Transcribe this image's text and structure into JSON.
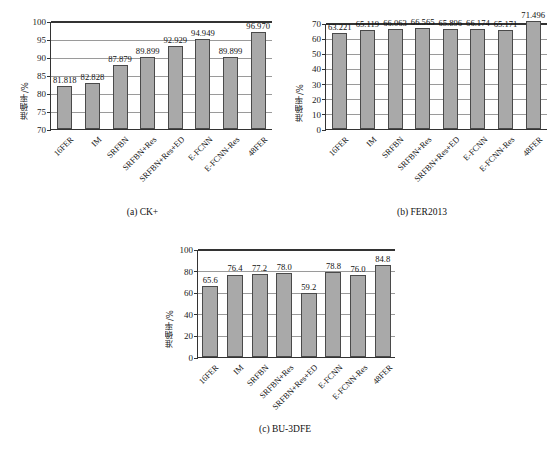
{
  "figure": {
    "background": "#ffffff",
    "bar_fill": "#a9a9a9",
    "bar_stroke": "#4a4a4a",
    "axis_color": "#333333",
    "grid_color": "#9a9a9a"
  },
  "panels": [
    {
      "id": "panel-a",
      "caption": "(a) CK+",
      "chart_data": {
        "type": "bar",
        "title": "(a) CK+",
        "xlabel": "",
        "ylabel": "准确率/%",
        "ylim": [
          70,
          100
        ],
        "ytick_step": 5,
        "yticks": [
          70,
          75,
          80,
          85,
          90,
          95,
          100
        ],
        "grid": true,
        "legend": "none",
        "categories": [
          "16FER",
          "IM",
          "SRFBN",
          "SRFBN+Res",
          "SRFBN+Res+ED",
          "E-FCNN",
          "E-FCNN-Res",
          "48FER"
        ],
        "values": [
          81.818,
          82.828,
          87.879,
          89.899,
          92.929,
          94.949,
          89.899,
          96.97
        ],
        "value_labels": [
          "81.818",
          "82.828",
          "87.879",
          "89.899",
          "92.929",
          "94.949",
          "89.899",
          "96.970"
        ]
      }
    },
    {
      "id": "panel-b",
      "caption": "(b) FER2013",
      "chart_data": {
        "type": "bar",
        "title": "(b) FER2013",
        "xlabel": "",
        "ylabel": "准确率/%",
        "ylim": [
          0,
          70
        ],
        "ytick_step": 10,
        "yticks": [
          0,
          10,
          20,
          30,
          40,
          50,
          60,
          70
        ],
        "grid": true,
        "legend": "none",
        "categories": [
          "16FER",
          "IM",
          "SRFBN",
          "SRFBN+Res",
          "SRFBN+Res+ED",
          "E-FCNN",
          "E-FCNN-Res",
          "48FER"
        ],
        "values": [
          63.221,
          65.119,
          66.063,
          66.565,
          65.896,
          66.174,
          65.171,
          71.496
        ],
        "value_labels": [
          "63.221",
          "65.119",
          "66.063",
          "66.565",
          "65.896",
          "66.174",
          "65.171",
          "71.496"
        ]
      }
    },
    {
      "id": "panel-c",
      "caption": "(c) BU-3DFE",
      "chart_data": {
        "type": "bar",
        "title": "(c) BU-3DFE",
        "xlabel": "",
        "ylabel": "准确率/%",
        "ylim": [
          0,
          100
        ],
        "ytick_step": 20,
        "yticks": [
          0,
          20,
          40,
          60,
          80,
          100
        ],
        "grid": true,
        "legend": "none",
        "categories": [
          "16FER",
          "IM",
          "SRFBN",
          "SRFBN+Res",
          "SRFBN+Res+ED",
          "E-FCNN",
          "E-FCNN-Res",
          "48FER"
        ],
        "values": [
          65.6,
          76.4,
          77.2,
          78.0,
          59.2,
          78.8,
          76.0,
          84.8
        ],
        "value_labels": [
          "65.6",
          "76.4",
          "77.2",
          "78.0",
          "59.2",
          "78.8",
          "76.0",
          "84.8"
        ]
      }
    }
  ]
}
